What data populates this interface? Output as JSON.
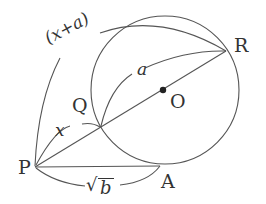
{
  "diagram": {
    "points": {
      "P": {
        "label": "P",
        "x": 35,
        "y": 167
      },
      "Q": {
        "label": "Q",
        "x": 100,
        "y": 127
      },
      "O": {
        "label": "O",
        "x": 163,
        "y": 90
      },
      "R": {
        "label": "R",
        "x": 226,
        "y": 51
      },
      "A": {
        "label": "A",
        "x": 160,
        "y": 166
      }
    },
    "circle": {
      "cx": 165,
      "cy": 90,
      "r": 74
    },
    "lengths": {
      "PQ": "x",
      "QR": "a",
      "PR": "(x+a)",
      "PA": "b"
    },
    "sqrt_symbol": "√",
    "colors": {
      "stroke": "#555555",
      "text": "#333333"
    }
  }
}
